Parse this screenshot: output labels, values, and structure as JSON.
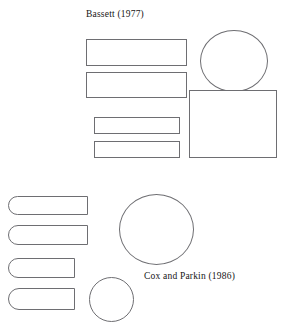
{
  "figure": {
    "background_color": "#ffffff",
    "stroke_color": "#6e6e72",
    "text_color": "#151515",
    "width": 292,
    "height": 330
  },
  "captions": {
    "bassett": "Bassett (1977)",
    "cox_parkin": "Cox and Parkin (1986)"
  },
  "panels": {
    "top": {
      "label": "Bassett (1977)",
      "shapes": [
        {
          "name": "bassett-bar-1",
          "type": "rectangle",
          "x": 86,
          "y": 39,
          "w": 101,
          "h": 27
        },
        {
          "name": "bassett-bar-2",
          "type": "rectangle",
          "x": 86,
          "y": 72,
          "w": 101,
          "h": 26
        },
        {
          "name": "bassett-bar-3",
          "type": "rectangle",
          "x": 94,
          "y": 117,
          "w": 86,
          "h": 17
        },
        {
          "name": "bassett-bar-4",
          "type": "rectangle",
          "x": 94,
          "y": 141,
          "w": 86,
          "h": 17
        },
        {
          "name": "bassett-circle",
          "type": "circle",
          "x": 200,
          "y": 30,
          "w": 68,
          "h": 62
        },
        {
          "name": "bassett-square",
          "type": "square",
          "x": 189,
          "y": 90,
          "w": 88,
          "h": 68
        }
      ]
    },
    "bottom": {
      "label": "Cox and Parkin (1986)",
      "shapes": [
        {
          "name": "cox-capsule-1",
          "type": "capsule",
          "x": 8,
          "y": 196,
          "w": 80,
          "h": 19
        },
        {
          "name": "cox-capsule-2",
          "type": "capsule",
          "x": 8,
          "y": 225,
          "w": 80,
          "h": 20
        },
        {
          "name": "cox-capsule-3",
          "type": "capsule",
          "x": 8,
          "y": 258,
          "w": 67,
          "h": 20
        },
        {
          "name": "cox-capsule-4",
          "type": "capsule",
          "x": 8,
          "y": 288,
          "w": 67,
          "h": 22
        },
        {
          "name": "cox-circle-large",
          "type": "circle",
          "x": 119,
          "y": 194,
          "w": 75,
          "h": 71
        },
        {
          "name": "cox-circle-small",
          "type": "circle",
          "x": 89,
          "y": 277,
          "w": 45,
          "h": 45
        }
      ]
    }
  }
}
